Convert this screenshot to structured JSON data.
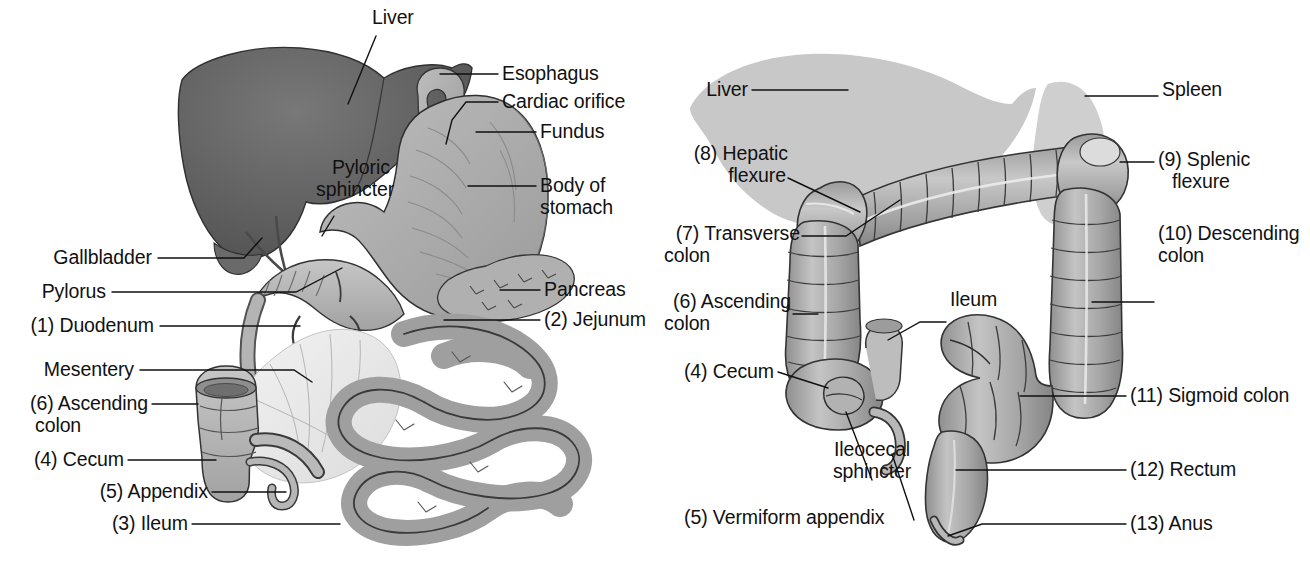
{
  "figure": {
    "background_color": "#ffffff",
    "text_color": "#111111",
    "organ_fill_light": "#c9c9c9",
    "organ_fill_mid": "#a9a9a9",
    "organ_fill_dark": "#6e6e6e",
    "liver_fill_dark": "#5c5c5c",
    "outline_color": "#3a3a3a"
  },
  "panel_left": {
    "name": "Stomach and small intestine panel",
    "labels": [
      {
        "id": "liver",
        "text": "Liver"
      },
      {
        "id": "esophagus",
        "text": "Esophagus"
      },
      {
        "id": "cardiac-orifice",
        "text": "Cardiac orifice"
      },
      {
        "id": "fundus",
        "text": "Fundus"
      },
      {
        "id": "body-of-stomach",
        "text": "Body of\nstomach"
      },
      {
        "id": "body-of-stomach-l1",
        "text": "Body of"
      },
      {
        "id": "body-of-stomach-l2",
        "text": "stomach"
      },
      {
        "id": "pyloric-sphincter",
        "text": "Pyloric\nsphincter"
      },
      {
        "id": "pyloric-sphincter-l1",
        "text": "Pyloric"
      },
      {
        "id": "pyloric-sphincter-l2",
        "text": "sphincter"
      },
      {
        "id": "gallbladder",
        "text": "Gallbladder"
      },
      {
        "id": "pylorus",
        "text": "Pylorus"
      },
      {
        "id": "duodenum",
        "text": "(1) Duodenum"
      },
      {
        "id": "mesentery",
        "text": "Mesentery"
      },
      {
        "id": "pancreas",
        "text": "Pancreas"
      },
      {
        "id": "jejunum",
        "text": "(2) Jejunum"
      },
      {
        "id": "ascending-colon",
        "text": "(6) Ascending\ncolon"
      },
      {
        "id": "ascending-colon-l1",
        "text": "(6) Ascending"
      },
      {
        "id": "ascending-colon-l2",
        "text": "colon"
      },
      {
        "id": "cecum",
        "text": "(4) Cecum"
      },
      {
        "id": "appendix",
        "text": "(5) Appendix"
      },
      {
        "id": "ileum",
        "text": "(3) Ileum"
      }
    ]
  },
  "panel_right": {
    "name": "Large intestine panel",
    "labels": [
      {
        "id": "liver",
        "text": "Liver"
      },
      {
        "id": "spleen",
        "text": "Spleen"
      },
      {
        "id": "hepatic-flexure",
        "text": "(8) Hepatic\nflexure"
      },
      {
        "id": "hepatic-flexure-l1",
        "text": "(8) Hepatic"
      },
      {
        "id": "hepatic-flexure-l2",
        "text": "flexure"
      },
      {
        "id": "splenic-flexure",
        "text": "(9) Splenic\nflexure"
      },
      {
        "id": "splenic-flexure-l1",
        "text": "(9) Splenic"
      },
      {
        "id": "splenic-flexure-l2",
        "text": "flexure"
      },
      {
        "id": "transverse-colon",
        "text": "(7) Transverse\ncolon"
      },
      {
        "id": "transverse-colon-l1",
        "text": "(7) Transverse"
      },
      {
        "id": "transverse-colon-l2",
        "text": "colon"
      },
      {
        "id": "descending-colon",
        "text": "(10) Descending\ncolon"
      },
      {
        "id": "descending-colon-l1",
        "text": "(10) Descending"
      },
      {
        "id": "descending-colon-l2",
        "text": "colon"
      },
      {
        "id": "ascending-colon",
        "text": "(6) Ascending\ncolon"
      },
      {
        "id": "ascending-colon-l1",
        "text": "(6) Ascending"
      },
      {
        "id": "ascending-colon-l2",
        "text": "colon"
      },
      {
        "id": "ileum",
        "text": "Ileum"
      },
      {
        "id": "cecum",
        "text": "(4) Cecum"
      },
      {
        "id": "sigmoid-colon",
        "text": "(11) Sigmoid colon"
      },
      {
        "id": "rectum",
        "text": "(12) Rectum"
      },
      {
        "id": "anus",
        "text": "(13) Anus"
      },
      {
        "id": "ileocecal-sphincter",
        "text": "Ileocecal\nsphincter"
      },
      {
        "id": "ileocecal-sphincter-l1",
        "text": "Ileocecal"
      },
      {
        "id": "ileocecal-sphincter-l2",
        "text": "sphincter"
      },
      {
        "id": "vermiform-appendix",
        "text": "(5) Vermiform appendix"
      }
    ]
  },
  "numbered_key": {
    "1": "Duodenum",
    "2": "Jejunum",
    "3": "Ileum",
    "4": "Cecum",
    "5": "Appendix / Vermiform appendix",
    "6": "Ascending colon",
    "7": "Transverse colon",
    "8": "Hepatic flexure",
    "9": "Splenic flexure",
    "10": "Descending colon",
    "11": "Sigmoid colon",
    "12": "Rectum",
    "13": "Anus"
  }
}
